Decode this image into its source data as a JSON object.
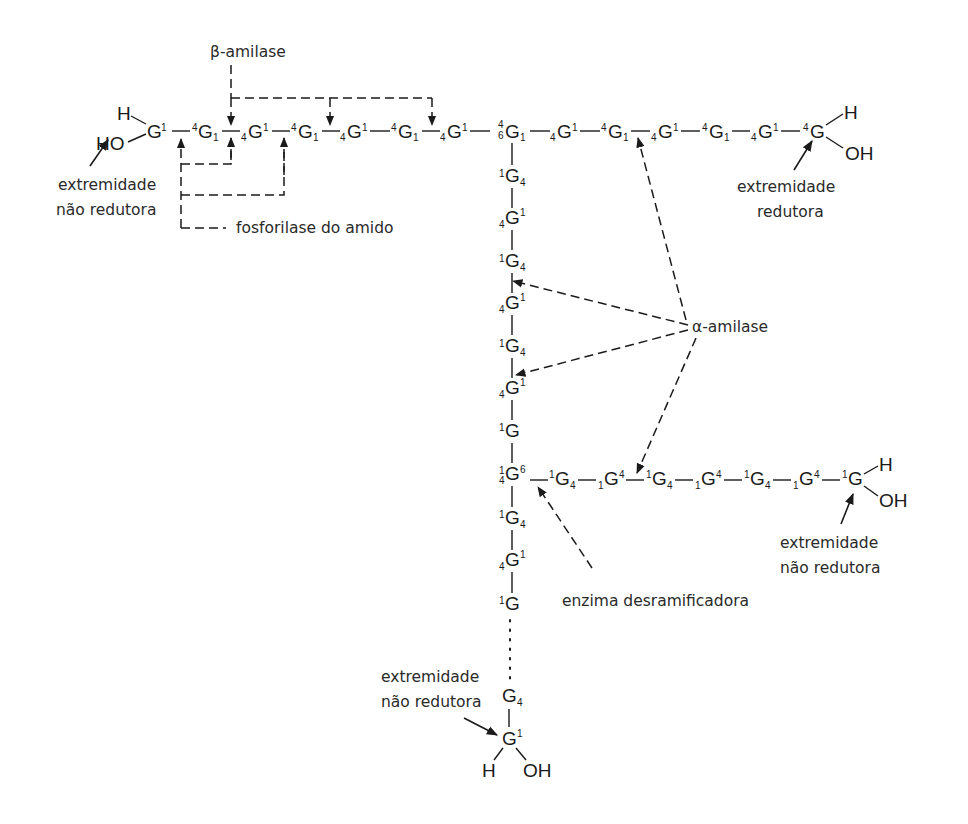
{
  "diagram": {
    "enzymes": {
      "beta_amylase": "β-amilase",
      "starch_phosphorylase": "fosforilase do amido",
      "alpha_amylase": "α-amilase",
      "debranching": "enzima desramificadora"
    },
    "ends": {
      "top_left": [
        "extremidade",
        "não redutora"
      ],
      "top_right": [
        "extremidade",
        "redutora"
      ],
      "branch_right": [
        "extremidade",
        "não redutora"
      ],
      "bottom": [
        "extremidade",
        "não redutora"
      ]
    },
    "atoms": {
      "H": "H",
      "OH": "OH",
      "HO": "HO"
    },
    "main_chain": [
      {
        "pre": "",
        "g": "G",
        "post": "1"
      },
      {
        "pre": "4",
        "g": "G",
        "post": "1s"
      },
      {
        "pre": "4s",
        "g": "G",
        "post": "1"
      },
      {
        "pre": "4",
        "g": "G",
        "post": "1s"
      },
      {
        "pre": "4s",
        "g": "G",
        "post": "1"
      },
      {
        "pre": "4",
        "g": "G",
        "post": "1s"
      },
      {
        "pre": "4s",
        "g": "G",
        "post": "1"
      },
      {
        "pre": "4/6",
        "g": "G",
        "post": "1s"
      },
      {
        "pre": "4s",
        "g": "G",
        "post": "1"
      },
      {
        "pre": "4",
        "g": "G",
        "post": "1s"
      },
      {
        "pre": "4s",
        "g": "G",
        "post": "1"
      },
      {
        "pre": "4",
        "g": "G",
        "post": "1s"
      },
      {
        "pre": "4s",
        "g": "G",
        "post": "1"
      },
      {
        "pre": "4",
        "g": "G",
        "post": ""
      }
    ],
    "vertical_chain": [
      "1G4",
      "4G1",
      "1G4",
      "4G1",
      "1G4",
      "4G1",
      "1G",
      "4 1G6",
      "1G4",
      "4G1",
      "1G",
      "G4",
      "G1"
    ],
    "branch_chain": [
      "1G4",
      "1G4",
      "1G4",
      "1G4",
      "1G4",
      "1G4",
      "1G"
    ]
  }
}
